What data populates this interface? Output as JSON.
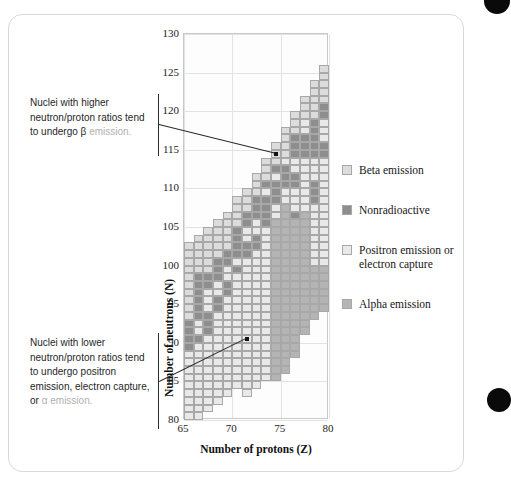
{
  "figure": {
    "kind": "nuclide-stability-chart"
  },
  "chart_data": {
    "type": "heatmap",
    "title": "",
    "xlabel": "Number of protons (Z)",
    "ylabel": "Number of neutrons (N)",
    "xlim": [
      65,
      80
    ],
    "ylim": [
      80,
      130
    ],
    "xticks": [
      65,
      70,
      75,
      80
    ],
    "yticks": [
      80,
      85,
      90,
      95,
      100,
      105,
      110,
      115,
      120,
      125,
      130
    ],
    "grid": true,
    "legend_position": "right",
    "cell_size": {
      "z": 1,
      "n": 1
    },
    "categories": [
      {
        "key": "beta",
        "label": "Beta emission",
        "color": "#dcdcdc"
      },
      {
        "key": "stable",
        "label": "Nonradioactive",
        "color": "#8e8e8e"
      },
      {
        "key": "positron",
        "label": "Positron emission or electron capture",
        "color": "#e9e9e9"
      },
      {
        "key": "alpha",
        "label": "Alpha emission",
        "color": "#b4b4b4"
      }
    ],
    "columns": [
      {
        "z": 65,
        "runs": [
          {
            "n0": 80,
            "n1": 88,
            "cat": "positron"
          },
          {
            "n0": 89,
            "n1": 92,
            "cat": "stable"
          },
          {
            "n0": 93,
            "n1": 102,
            "cat": "beta"
          }
        ]
      },
      {
        "z": 66,
        "runs": [
          {
            "n0": 80,
            "n1": 89,
            "cat": "positron"
          },
          {
            "n0": 90,
            "n1": 90,
            "cat": "stable"
          },
          {
            "n0": 91,
            "n1": 92,
            "cat": "positron"
          },
          {
            "n0": 93,
            "n1": 98,
            "cat": "stable"
          },
          {
            "n0": 99,
            "n1": 103,
            "cat": "beta"
          }
        ]
      },
      {
        "z": 67,
        "runs": [
          {
            "n0": 81,
            "n1": 90,
            "cat": "positron"
          },
          {
            "n0": 91,
            "n1": 93,
            "cat": "stable"
          },
          {
            "n0": 94,
            "n1": 96,
            "cat": "positron"
          },
          {
            "n0": 97,
            "n1": 98,
            "cat": "stable"
          },
          {
            "n0": 99,
            "n1": 104,
            "cat": "beta"
          }
        ]
      },
      {
        "z": 68,
        "runs": [
          {
            "n0": 82,
            "n1": 93,
            "cat": "positron"
          },
          {
            "n0": 94,
            "n1": 95,
            "cat": "stable"
          },
          {
            "n0": 96,
            "n1": 97,
            "cat": "positron"
          },
          {
            "n0": 98,
            "n1": 100,
            "cat": "stable"
          },
          {
            "n0": 101,
            "n1": 105,
            "cat": "beta"
          }
        ]
      },
      {
        "z": 69,
        "runs": [
          {
            "n0": 83,
            "n1": 95,
            "cat": "positron"
          },
          {
            "n0": 96,
            "n1": 97,
            "cat": "stable"
          },
          {
            "n0": 98,
            "n1": 99,
            "cat": "positron"
          },
          {
            "n0": 100,
            "n1": 101,
            "cat": "stable"
          },
          {
            "n0": 102,
            "n1": 106,
            "cat": "beta"
          }
        ]
      },
      {
        "z": 70,
        "runs": [
          {
            "n0": 84,
            "n1": 98,
            "cat": "positron"
          },
          {
            "n0": 99,
            "n1": 99,
            "cat": "stable"
          },
          {
            "n0": 100,
            "n1": 100,
            "cat": "positron"
          },
          {
            "n0": 101,
            "n1": 104,
            "cat": "stable"
          },
          {
            "n0": 105,
            "n1": 108,
            "cat": "beta"
          }
        ]
      },
      {
        "z": 71,
        "runs": [
          {
            "n0": 83,
            "n1": 100,
            "cat": "positron"
          },
          {
            "n0": 101,
            "n1": 102,
            "cat": "stable"
          },
          {
            "n0": 103,
            "n1": 104,
            "cat": "positron"
          },
          {
            "n0": 105,
            "n1": 106,
            "cat": "stable"
          },
          {
            "n0": 107,
            "n1": 109,
            "cat": "beta"
          }
        ]
      },
      {
        "z": 72,
        "runs": [
          {
            "n0": 84,
            "n1": 101,
            "cat": "positron"
          },
          {
            "n0": 102,
            "n1": 103,
            "cat": "stable"
          },
          {
            "n0": 104,
            "n1": 105,
            "cat": "positron"
          },
          {
            "n0": 106,
            "n1": 108,
            "cat": "stable"
          },
          {
            "n0": 109,
            "n1": 111,
            "cat": "beta"
          }
        ]
      },
      {
        "z": 73,
        "runs": [
          {
            "n0": 85,
            "n1": 104,
            "cat": "positron"
          },
          {
            "n0": 105,
            "n1": 108,
            "cat": "stable"
          },
          {
            "n0": 109,
            "n1": 109,
            "cat": "positron"
          },
          {
            "n0": 110,
            "n1": 110,
            "cat": "stable"
          },
          {
            "n0": 111,
            "n1": 113,
            "cat": "beta"
          }
        ]
      },
      {
        "z": 74,
        "runs": [
          {
            "n0": 85,
            "n1": 105,
            "cat": "alpha"
          },
          {
            "n0": 106,
            "n1": 107,
            "cat": "positron"
          },
          {
            "n0": 108,
            "n1": 110,
            "cat": "stable"
          },
          {
            "n0": 111,
            "n1": 111,
            "cat": "positron"
          },
          {
            "n0": 112,
            "n1": 112,
            "cat": "stable"
          },
          {
            "n0": 113,
            "n1": 115,
            "cat": "beta"
          }
        ]
      },
      {
        "z": 75,
        "runs": [
          {
            "n0": 86,
            "n1": 107,
            "cat": "alpha"
          },
          {
            "n0": 108,
            "n1": 109,
            "cat": "positron"
          },
          {
            "n0": 110,
            "n1": 112,
            "cat": "stable"
          },
          {
            "n0": 113,
            "n1": 113,
            "cat": "positron"
          },
          {
            "n0": 114,
            "n1": 117,
            "cat": "beta"
          }
        ]
      },
      {
        "z": 76,
        "runs": [
          {
            "n0": 88,
            "n1": 105,
            "cat": "alpha"
          },
          {
            "n0": 106,
            "n1": 106,
            "cat": "stable"
          },
          {
            "n0": 107,
            "n1": 109,
            "cat": "positron"
          },
          {
            "n0": 110,
            "n1": 111,
            "cat": "stable"
          },
          {
            "n0": 112,
            "n1": 113,
            "cat": "positron"
          },
          {
            "n0": 114,
            "n1": 116,
            "cat": "stable"
          },
          {
            "n0": 117,
            "n1": 119,
            "cat": "beta"
          }
        ]
      },
      {
        "z": 77,
        "runs": [
          {
            "n0": 91,
            "n1": 106,
            "cat": "alpha"
          },
          {
            "n0": 107,
            "n1": 113,
            "cat": "positron"
          },
          {
            "n0": 114,
            "n1": 116,
            "cat": "stable"
          },
          {
            "n0": 117,
            "n1": 118,
            "cat": "positron"
          },
          {
            "n0": 119,
            "n1": 121,
            "cat": "beta"
          }
        ]
      },
      {
        "z": 78,
        "runs": [
          {
            "n0": 93,
            "n1": 99,
            "cat": "alpha"
          },
          {
            "n0": 100,
            "n1": 107,
            "cat": "positron"
          },
          {
            "n0": 108,
            "n1": 110,
            "cat": "stable"
          },
          {
            "n0": 111,
            "n1": 113,
            "cat": "positron"
          },
          {
            "n0": 114,
            "n1": 118,
            "cat": "stable"
          },
          {
            "n0": 119,
            "n1": 123,
            "cat": "beta"
          }
        ]
      },
      {
        "z": 79,
        "runs": [
          {
            "n0": 94,
            "n1": 99,
            "cat": "alpha"
          },
          {
            "n0": 100,
            "n1": 113,
            "cat": "positron"
          },
          {
            "n0": 114,
            "n1": 115,
            "cat": "stable"
          },
          {
            "n0": 116,
            "n1": 118,
            "cat": "positron"
          },
          {
            "n0": 119,
            "n1": 120,
            "cat": "stable"
          },
          {
            "n0": 121,
            "n1": 125,
            "cat": "beta"
          }
        ]
      }
    ]
  },
  "axes": {
    "x": {
      "title": "Number of protons (Z)",
      "ticks": [
        "65",
        "70",
        "75",
        "80"
      ]
    },
    "y": {
      "title": "Number of neutrons (N)",
      "ticks": [
        "130",
        "125",
        "120",
        "115",
        "110",
        "105",
        "100",
        "95",
        "90",
        "85",
        "80"
      ]
    }
  },
  "legend": {
    "items": [
      {
        "label": "Beta emission",
        "color": "#dcdcdc"
      },
      {
        "label": "Nonradioactive",
        "color": "#8e8e8e"
      },
      {
        "label": "Positron emission or electron capture",
        "color": "#e9e9e9"
      },
      {
        "label": "Alpha emission",
        "color": "#b4b4b4"
      }
    ]
  },
  "annotations": {
    "top": {
      "text_main": "Nuclei with higher neutron/proton ratios tend to undergo β",
      "text_dim": "emission.",
      "target": {
        "z": 74,
        "n": 114
      }
    },
    "bottom": {
      "text_main": "Nuclei with lower neutron/proton ratios tend to undergo positron emission, electron capture,",
      "text_dim_prefix": "or",
      "text_dim": "α emission.",
      "target": {
        "z": 71,
        "n": 90
      }
    }
  }
}
